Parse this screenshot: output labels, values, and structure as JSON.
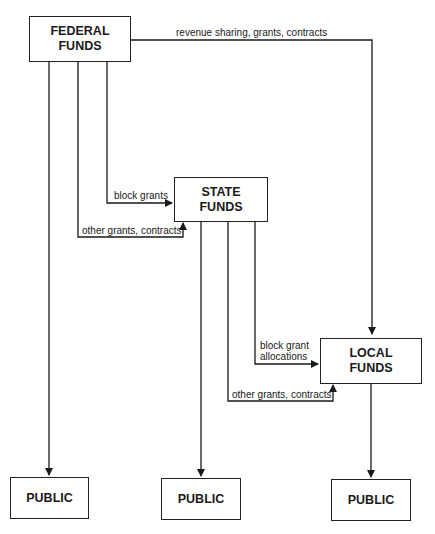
{
  "nodes": {
    "federal": {
      "line1": "FEDERAL",
      "line2": "FUNDS"
    },
    "state": {
      "line1": "STATE",
      "line2": "FUNDS"
    },
    "local": {
      "line1": "LOCAL",
      "line2": "FUNDS"
    },
    "public_1": {
      "label": "PUBLIC"
    },
    "public_2": {
      "label": "PUBLIC"
    },
    "public_3": {
      "label": "PUBLIC"
    }
  },
  "edges": {
    "federal_to_local": "revenue sharing, grants, contracts",
    "federal_to_state_block": "block grants",
    "federal_to_state_other": "other grants, contracts",
    "state_to_local_block_line1": "block grant",
    "state_to_local_block_line2": "allocations",
    "state_to_local_other": "other grants, contracts"
  }
}
